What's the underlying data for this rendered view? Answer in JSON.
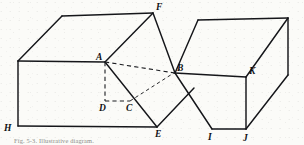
{
  "figure": {
    "type": "line-drawing",
    "background_color": "#fbfbf8",
    "ink_color": "#15161a",
    "canvas": {
      "width": 304,
      "height": 145
    },
    "caption": {
      "lead": "Fig.",
      "text": "Fig. 5-3. Illustrative diagram.",
      "visible": "partially cut off at bottom edge"
    },
    "vertex_labels": [
      {
        "id": "A",
        "text": "A",
        "x": 98,
        "y": 59,
        "vertex_x": 105,
        "vertex_y": 62
      },
      {
        "id": "B",
        "text": "B",
        "x": 178,
        "y": 70,
        "vertex_x": 175,
        "vertex_y": 73
      },
      {
        "id": "C",
        "text": "C",
        "x": 128,
        "y": 110,
        "vertex_x": 130,
        "vertex_y": 101
      },
      {
        "id": "D",
        "text": "D",
        "x": 100,
        "y": 110,
        "vertex_x": 105,
        "vertex_y": 101
      },
      {
        "id": "E",
        "text": "E",
        "x": 158,
        "y": 135,
        "vertex_x": 157,
        "vertex_y": 127
      },
      {
        "id": "F",
        "text": "F",
        "x": 157,
        "y": 9,
        "vertex_x": 153,
        "vertex_y": 13
      },
      {
        "id": "H",
        "text": "H",
        "x": 6,
        "y": 130,
        "vertex_x": 18,
        "vertex_y": 126
      },
      {
        "id": "I",
        "text": "I",
        "x": 210,
        "y": 138,
        "vertex_x": 212,
        "vertex_y": 129
      },
      {
        "id": "J",
        "text": "J",
        "x": 245,
        "y": 139,
        "vertex_x": 246,
        "vertex_y": 129
      },
      {
        "id": "K",
        "text": "K",
        "x": 250,
        "y": 73,
        "vertex_x": 246,
        "vertex_y": 77
      }
    ],
    "solid_edges": [
      {
        "name": "left-box-top-back",
        "points": "62,16 153,13"
      },
      {
        "name": "left-box-top-left-slant",
        "points": "62,16 18,61"
      },
      {
        "name": "left-box-top-front",
        "points": "18,61 105,62"
      },
      {
        "name": "left-box-front-left",
        "points": "18,61 18,126"
      },
      {
        "name": "left-box-front-bottom",
        "points": "18,126 157,127"
      },
      {
        "name": "diamond-a-to-f",
        "points": "105,62 153,13"
      },
      {
        "name": "diamond-f-to-b",
        "points": "153,13 175,73"
      },
      {
        "name": "diamond-a-to-c-e",
        "points": "105,62 157,127"
      },
      {
        "name": "diamond-e-to-b-corner",
        "points": "157,127 194,88"
      },
      {
        "name": "right-box-top-back",
        "points": "198,20 288,18"
      },
      {
        "name": "right-box-top-left-slant",
        "points": "198,20 175,73"
      },
      {
        "name": "right-box-top-front",
        "points": "175,73 246,77"
      },
      {
        "name": "right-box-top-right-slant",
        "points": "288,18 246,77"
      },
      {
        "name": "right-box-front-vertical",
        "points": "246,77 246,129"
      },
      {
        "name": "right-box-right-vertical",
        "points": "288,18 288,75"
      },
      {
        "name": "right-box-right-slant-low",
        "points": "288,75 246,129"
      },
      {
        "name": "right-box-b-to-i",
        "points": "175,73 212,129"
      },
      {
        "name": "right-box-bottom-front",
        "points": "212,129 246,129"
      }
    ],
    "dashed_edges": [
      {
        "name": "hidden-a-to-b",
        "points": "105,62 175,73"
      },
      {
        "name": "hidden-a-to-d",
        "points": "105,62 105,101"
      },
      {
        "name": "hidden-d-to-c",
        "points": "105,101 130,101"
      },
      {
        "name": "hidden-c-to-b",
        "points": "130,101 180,69"
      }
    ]
  }
}
